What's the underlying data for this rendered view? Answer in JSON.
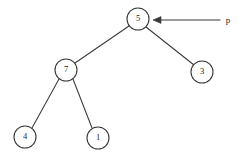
{
  "diagram": {
    "background_color": "#ffffff",
    "stroke_color": "#3a3a3a",
    "text_color": "#262626",
    "nodes": [
      {
        "id": "root",
        "label": "5",
        "cx": 138,
        "cy": 19,
        "r": 11
      },
      {
        "id": "left",
        "label": "7",
        "cx": 66,
        "cy": 70,
        "r": 11
      },
      {
        "id": "right",
        "label": "3",
        "cx": 202,
        "cy": 72,
        "r": 11
      },
      {
        "id": "left-left",
        "label": "4",
        "cx": 25,
        "cy": 137,
        "r": 11
      },
      {
        "id": "left-right",
        "label": "1",
        "cx": 98,
        "cy": 138,
        "r": 11
      }
    ],
    "edges": [
      {
        "id": "edge-root-left",
        "from": "5",
        "to": "7",
        "x1": 129,
        "y1": 26,
        "x2": 75,
        "y2": 63
      },
      {
        "id": "edge-root-right",
        "from": "5",
        "to": "3",
        "x1": 146,
        "y1": 27,
        "x2": 194,
        "y2": 65
      },
      {
        "id": "edge-left-leftleft",
        "from": "7",
        "to": "4",
        "x1": 59,
        "y1": 79,
        "x2": 32,
        "y2": 128
      },
      {
        "id": "edge-left-leftright",
        "from": "7",
        "to": "1",
        "x1": 73,
        "y1": 79,
        "x2": 92,
        "y2": 128
      }
    ],
    "pointer": {
      "label": "p",
      "label_x": 228,
      "label_y": 21,
      "line_x1": 220,
      "line_x2": 158,
      "line_y": 20,
      "arrow_tip_x": 153,
      "arrow_tip_y": 20,
      "target_node": "5"
    }
  }
}
